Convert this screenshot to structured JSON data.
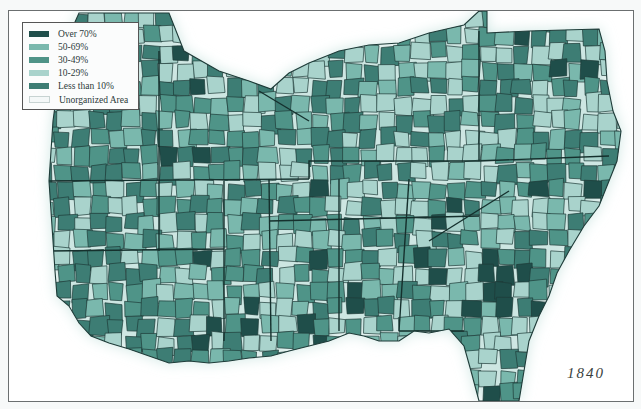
{
  "map": {
    "year_label": "1840",
    "region": "Southern United States (counties)",
    "legend": [
      {
        "label": "Over 70%",
        "color": "#1f4e4a"
      },
      {
        "label": "50-69%",
        "color": "#7ab8ad"
      },
      {
        "label": "30-49%",
        "color": "#4f9488"
      },
      {
        "label": "10-29%",
        "color": "#a9d3cc"
      },
      {
        "label": "Less than 10%",
        "color": "#3d7d74"
      },
      {
        "label": "Unorganized Area",
        "color": "#f4f8f8"
      }
    ],
    "border_color": "#1e3b38",
    "water_halo_color": "#cde6e2"
  }
}
